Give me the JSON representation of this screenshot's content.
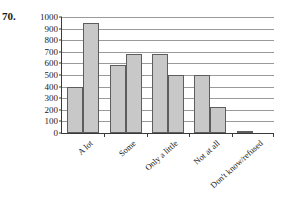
{
  "problem": {
    "number": "70."
  },
  "chart_data": {
    "type": "bar",
    "title": "",
    "xlabel": "",
    "ylabel": "",
    "ylim": [
      0,
      1000
    ],
    "ytick_step": 100,
    "yticks": [
      0,
      100,
      200,
      300,
      400,
      500,
      600,
      700,
      800,
      900,
      1000
    ],
    "ytick_labels": [
      "0",
      "100",
      "200",
      "300",
      "400",
      "500",
      "600",
      "700",
      "800",
      "900",
      "1000"
    ],
    "grid": true,
    "legend": "none",
    "categories": [
      "A lot",
      "Some",
      "Only a little",
      "Not at all",
      "Don't know/refused"
    ],
    "series": [
      {
        "name": "Series 1",
        "values": [
          400,
          590,
          680,
          500,
          20
        ]
      },
      {
        "name": "Series 2",
        "values": [
          950,
          680,
          500,
          220,
          0
        ]
      }
    ],
    "bar_color": "#c8c8c8",
    "bar_edge_color": "#5d5d5d",
    "axis_color": "#3a3a3a",
    "grid_color": "#9a9a9a"
  }
}
